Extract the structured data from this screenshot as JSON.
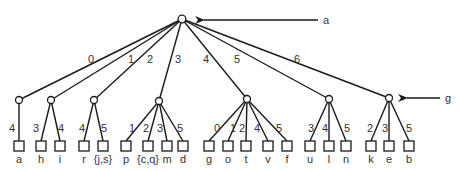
{
  "diagram": {
    "type": "tree",
    "root": {
      "id": "root",
      "x": 182,
      "y": 19
    },
    "pointer_a": {
      "label": "a",
      "x1": 318,
      "y": 20,
      "x2": 192,
      "lx": 323
    },
    "pointer_g": {
      "label": "g",
      "x1": 440,
      "y": 98,
      "x2": 397,
      "lx": 445
    },
    "root_edges": [
      {
        "label": "0",
        "lx": 88,
        "ly": 63
      },
      {
        "label": "1",
        "lx": 128,
        "ly": 63
      },
      {
        "label": "2",
        "lx": 147,
        "ly": 63
      },
      {
        "label": "3",
        "lx": 175,
        "ly": 63
      },
      {
        "label": "4",
        "lx": 203,
        "ly": 63
      },
      {
        "label": "5",
        "lx": 234,
        "ly": 63
      },
      {
        "label": "6",
        "lx": 294,
        "ly": 63
      }
    ],
    "children": [
      {
        "x": 19,
        "y": 100,
        "leaves": [
          {
            "x": 19,
            "label": "a",
            "edge": "4",
            "elx": 9,
            "ely": 132
          }
        ]
      },
      {
        "x": 51,
        "y": 100,
        "leaves": [
          {
            "x": 41,
            "label": "h",
            "edge": "3",
            "elx": 33,
            "ely": 132
          },
          {
            "x": 60,
            "label": "i",
            "edge": "4",
            "elx": 58,
            "ely": 132
          }
        ]
      },
      {
        "x": 94,
        "y": 100,
        "leaves": [
          {
            "x": 84,
            "label": "r",
            "edge": "4",
            "elx": 79,
            "ely": 132
          },
          {
            "x": 103,
            "label": "{j,s}",
            "edge": "5",
            "elx": 101,
            "ely": 132
          }
        ]
      },
      {
        "x": 159,
        "y": 101,
        "leaves": [
          {
            "x": 126,
            "label": "p",
            "edge": "1",
            "elx": 129,
            "ely": 132
          },
          {
            "x": 148,
            "label": "{c,q}",
            "edge": "2",
            "elx": 143,
            "ely": 132
          },
          {
            "x": 167,
            "label": "m",
            "edge": "3",
            "elx": 157,
            "ely": 132
          },
          {
            "x": 183,
            "label": "d",
            "edge": "5",
            "elx": 177,
            "ely": 132
          }
        ]
      },
      {
        "x": 247,
        "y": 99,
        "leaves": [
          {
            "x": 209,
            "label": "g",
            "edge": "0",
            "elx": 214,
            "ely": 132
          },
          {
            "x": 228,
            "label": "o",
            "edge": "1",
            "elx": 230,
            "ely": 132
          },
          {
            "x": 246,
            "label": "t",
            "edge": "2",
            "elx": 239,
            "ely": 132
          },
          {
            "x": 268,
            "label": "v",
            "edge": "4",
            "elx": 254,
            "ely": 132
          },
          {
            "x": 287,
            "label": "f",
            "edge": "5",
            "elx": 276,
            "ely": 132
          }
        ]
      },
      {
        "x": 329,
        "y": 99,
        "leaves": [
          {
            "x": 310,
            "label": "u",
            "edge": "3",
            "elx": 308,
            "ely": 132
          },
          {
            "x": 329,
            "label": "l",
            "edge": "4",
            "elx": 322,
            "ely": 132
          },
          {
            "x": 346,
            "label": "n",
            "edge": "5",
            "elx": 344,
            "ely": 132
          }
        ]
      },
      {
        "x": 389,
        "y": 98,
        "leaves": [
          {
            "x": 371,
            "label": "k",
            "edge": "2",
            "elx": 367,
            "ely": 132
          },
          {
            "x": 389,
            "label": "e",
            "edge": "3",
            "elx": 382,
            "ely": 132
          },
          {
            "x": 409,
            "label": "b",
            "edge": "5",
            "elx": 406,
            "ely": 132
          }
        ]
      }
    ],
    "leaf_y": 146,
    "leaf_label_y": 163
  }
}
